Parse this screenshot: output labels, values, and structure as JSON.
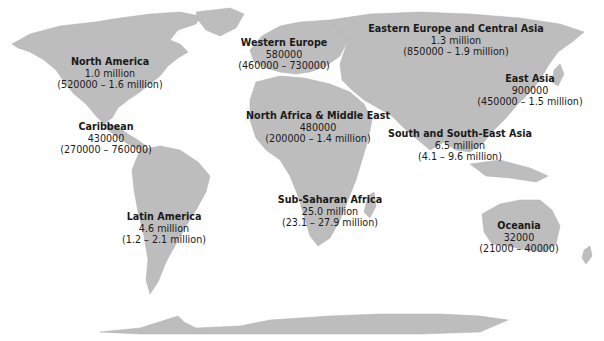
{
  "map": {
    "land_color": "#bdbdbd",
    "background_color": "#ffffff",
    "regions": [
      {
        "name": "North America",
        "estimate": "1.0 million",
        "range": "(520000 – 1.6 million)",
        "x": 110,
        "y": 56
      },
      {
        "name": "Caribbean",
        "estimate": "430000",
        "range": "(270000 – 760000)",
        "x": 106,
        "y": 121
      },
      {
        "name": "Latin America",
        "estimate": "4.6 million",
        "range": "(1.2 – 2.1 million)",
        "x": 164,
        "y": 211
      },
      {
        "name": "Western Europe",
        "estimate": "580000",
        "range": "(460000 – 730000)",
        "x": 284,
        "y": 37
      },
      {
        "name": "North Africa & Middle East",
        "estimate": "480000",
        "range": "(200000 – 1.4 million)",
        "x": 318,
        "y": 110
      },
      {
        "name": "Sub-Saharan Africa",
        "estimate": "25.0 million",
        "range": "(23.1 – 27.9 million)",
        "x": 330,
        "y": 194
      },
      {
        "name": "Eastern Europe and Central Asia",
        "estimate": "1.3 million",
        "range": "(850000 – 1.9 million)",
        "x": 456,
        "y": 23
      },
      {
        "name": "East Asia",
        "estimate": "900000",
        "range": "(450000 – 1.5 million)",
        "x": 530,
        "y": 73
      },
      {
        "name": "South and South-East Asia",
        "estimate": "6.5 million",
        "range": "(4.1 – 9.6 million)",
        "x": 460,
        "y": 128
      },
      {
        "name": "Oceania",
        "estimate": "32000",
        "range": "(21000 – 40000)",
        "x": 519,
        "y": 220
      }
    ]
  }
}
